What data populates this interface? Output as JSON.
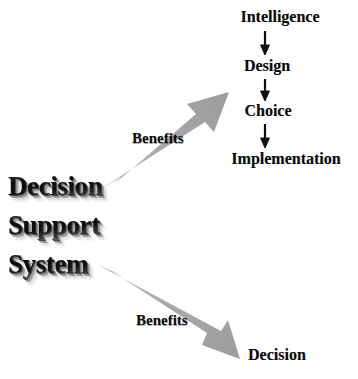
{
  "diagram": {
    "title": "Decision Support System Benefits",
    "type": "flow-diagram",
    "canvas": {
      "width": 358,
      "height": 379,
      "background": "#ffffff"
    },
    "colors": {
      "arrow_gray": "#ababab",
      "arrow_gray_light": "#c4c4c4",
      "arrow_gray_dark": "#949494",
      "text_black": "#0a0a0a"
    }
  },
  "source": {
    "name": "decision-support-system",
    "lines": [
      "Decision",
      "Support",
      "System"
    ],
    "style": "3d-extruded-gradient"
  },
  "benefit_arrows": [
    {
      "name": "benefit-arrow-up",
      "label": "Benefits",
      "direction": "up-right"
    },
    {
      "name": "benefit-arrow-down",
      "label": "Benefits",
      "direction": "down-right"
    }
  ],
  "process": {
    "name": "decision-making-phases",
    "phases": [
      {
        "label": "Intelligence"
      },
      {
        "label": "Design"
      },
      {
        "label": "Choice"
      },
      {
        "label": "Implementation"
      }
    ],
    "connector": "down-arrow"
  },
  "outcome": {
    "label": "Decision"
  }
}
